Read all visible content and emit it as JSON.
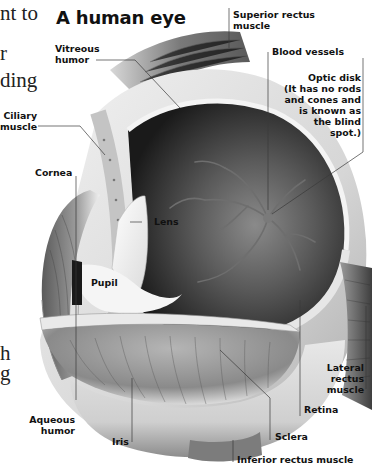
{
  "figure": {
    "title": "A human eye",
    "body_text_fragments": [
      "nt to",
      "r",
      "ding",
      "h",
      "g"
    ],
    "labels": {
      "superior_rectus": [
        "Superior rectus",
        "muscle"
      ],
      "vitreous_humor": [
        "Vitreous",
        "humor"
      ],
      "blood_vessels": [
        "Blood vessels"
      ],
      "optic_disk": [
        "Optic disk",
        "(It has no rods",
        "and cones and",
        "is known as",
        "the blind",
        "spot.)"
      ],
      "ciliary_muscle": [
        "Ciliary",
        "muscle"
      ],
      "cornea": [
        "Cornea"
      ],
      "lens": [
        "Lens"
      ],
      "pupil": [
        "Pupil"
      ],
      "lateral_rectus": [
        "Lateral",
        "rectus",
        "muscle"
      ],
      "retina": [
        "Retina"
      ],
      "aqueous_humor": [
        "Aqueous",
        "humor"
      ],
      "iris": [
        "Iris"
      ],
      "sclera": [
        "Sclera"
      ],
      "inferior_rectus": [
        "Inferior rectus muscle"
      ]
    }
  },
  "colors": {
    "ink": "#111111",
    "leader": "#3a3a3a",
    "background": "#ffffff"
  }
}
